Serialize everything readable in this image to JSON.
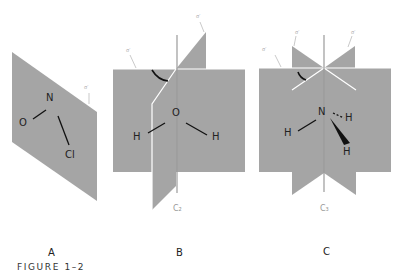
{
  "figure": {
    "caption": "FIGURE 1–2",
    "colors": {
      "plane": "#a5a5a5",
      "edge": "#ffffff",
      "axis": "#9a9a9a",
      "ink": "#111111",
      "background": "#ffffff"
    },
    "panels": [
      {
        "id": "A",
        "label": "A",
        "molecule": "NOCl",
        "atoms": [
          "N",
          "O",
          "Cl"
        ],
        "plane_label": "σ′"
      },
      {
        "id": "B",
        "label": "B",
        "molecule": "H2O",
        "atoms": [
          "O",
          "H",
          "H"
        ],
        "plane_labels": [
          "σ′",
          "σ′"
        ],
        "axis_label": "C₂"
      },
      {
        "id": "C",
        "label": "C",
        "molecule": "NH3",
        "atoms": [
          "N",
          "H",
          "H",
          "H"
        ],
        "plane_labels": [
          "σ′",
          "σ′",
          "σ′"
        ],
        "axis_label": "C₃"
      }
    ]
  }
}
